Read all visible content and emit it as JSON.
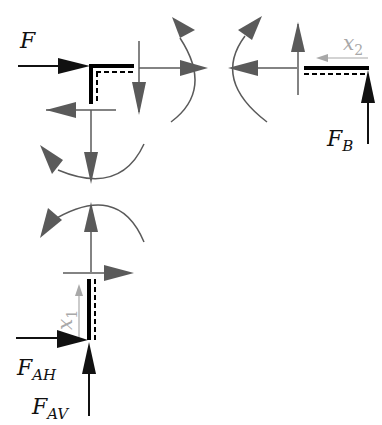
{
  "diagram": {
    "type": "free-body diagram",
    "colors": {
      "external_force": "#111111",
      "internal_force": "#5a5a5a",
      "coordinate_arrow": "#a8a8a8",
      "beam": "#000000",
      "background": "#ffffff"
    },
    "labels": {
      "force_F": {
        "main": "F",
        "sub": ""
      },
      "force_FB": {
        "main": "F",
        "sub": "B"
      },
      "force_FAH": {
        "main": "F",
        "sub": "AH"
      },
      "force_FAV": {
        "main": "F",
        "sub": "AV"
      },
      "coord_x1": {
        "main": "x",
        "sub": "1"
      },
      "coord_x2": {
        "main": "x",
        "sub": "2"
      }
    },
    "segments": [
      {
        "name": "corner-segment",
        "description": "L-shaped corner with applied force F"
      },
      {
        "name": "right-segment",
        "description": "Horizontal beam with support reaction F_B and coordinate x2"
      },
      {
        "name": "bottom-segment",
        "description": "Vertical column with support reactions F_AH, F_AV and coordinate x1"
      }
    ]
  }
}
